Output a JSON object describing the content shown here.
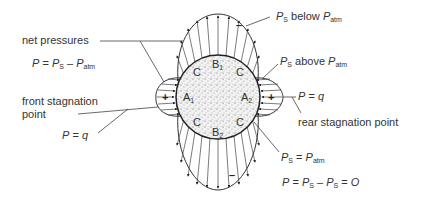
{
  "diagram": {
    "labels": {
      "net_pressures": "net pressures",
      "net_eq_P": "P",
      "net_eq_mid": " = ",
      "net_eq_Ps": "P",
      "net_eq_Ps_sub": "S",
      "net_eq_minus": " – ",
      "net_eq_Patm": "P",
      "net_eq_Patm_sub": "atm",
      "front_stag_line1": "front stagnation",
      "front_stag_line2": "point",
      "front_P": "P",
      "front_eq": " = ",
      "front_q": "q",
      "below_P": "P",
      "below_sub": "S",
      "below_text": " below ",
      "below_Patm": "P",
      "below_Patm_sub": "atm",
      "above_P": "P",
      "above_sub": "S",
      "above_text": " above ",
      "above_Patm": "P",
      "above_Patm_sub": "atm",
      "rear_P": "P",
      "rear_eq": " = ",
      "rear_q": "q",
      "rear_stag": "rear stagnation point",
      "eqatm_P": "P",
      "eqatm_sub": "S",
      "eqatm_eq": " = ",
      "eqatm_Patm": "P",
      "eqatm_Patm_sub": "atm",
      "zero_P": "P",
      "zero_eq": " = ",
      "zero_Ps1": "P",
      "zero_Ps1_sub": "S",
      "zero_minus": " – ",
      "zero_Ps2": "P",
      "zero_Ps2_sub": "S",
      "zero_eq2": " = ",
      "zero_O": "O"
    },
    "points": {
      "A1": "A",
      "A1_sub": "1",
      "A2": "A",
      "A2_sub": "2",
      "B1": "B",
      "B1_sub": "1",
      "B2": "B",
      "B2_sub": "2",
      "C": "C"
    },
    "signs": {
      "positive": "+",
      "negative": "–"
    },
    "colors": {
      "line": "#333333",
      "fill_body": "#e6e6e6",
      "background": "#ffffff"
    }
  }
}
